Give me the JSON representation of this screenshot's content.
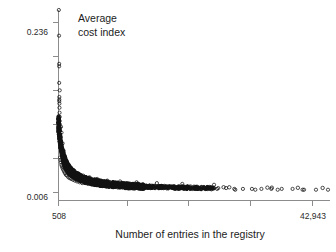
{
  "chart_data": {
    "type": "scatter",
    "title": "",
    "annotation": {
      "line1": "Average",
      "line2": "cost index"
    },
    "xlabel": "Number of entries in the registry",
    "ylabel": "Average cost index",
    "xlim": [
      508,
      42943
    ],
    "ylim": [
      0.006,
      0.236
    ],
    "xtick_labels": [
      "508",
      "42,943"
    ],
    "ytick_labels": [
      "0.236",
      "0.006"
    ],
    "x_min_label": "508",
    "x_max_label": "42,943",
    "y_min_label": "0.006",
    "y_max_label": "0.236",
    "grid": false,
    "legend": null,
    "marker": "open-circle",
    "marker_color": "#111111",
    "n_xticks": 5,
    "n_yticks": 6,
    "points": [
      [
        560,
        0.236
      ],
      [
        590,
        0.205
      ],
      [
        610,
        0.171
      ],
      [
        605,
        0.168
      ],
      [
        612,
        0.148
      ],
      [
        700,
        0.139
      ],
      [
        640,
        0.131
      ],
      [
        628,
        0.128
      ],
      [
        630,
        0.126
      ],
      [
        648,
        0.123
      ],
      [
        660,
        0.118
      ],
      [
        672,
        0.112
      ],
      [
        690,
        0.107
      ],
      [
        700,
        0.102
      ],
      [
        712,
        0.098
      ],
      [
        726,
        0.094
      ],
      [
        742,
        0.09
      ],
      [
        760,
        0.086
      ],
      [
        780,
        0.083
      ],
      [
        800,
        0.08
      ],
      [
        824,
        0.077
      ],
      [
        850,
        0.074
      ],
      [
        878,
        0.071
      ],
      [
        906,
        0.068
      ],
      [
        938,
        0.066
      ],
      [
        972,
        0.064
      ],
      [
        1008,
        0.062
      ],
      [
        1046,
        0.06
      ],
      [
        1086,
        0.058
      ],
      [
        1128,
        0.056
      ],
      [
        1172,
        0.054
      ],
      [
        1220,
        0.053
      ],
      [
        1270,
        0.051
      ],
      [
        1324,
        0.05
      ],
      [
        1380,
        0.048
      ],
      [
        1440,
        0.047
      ],
      [
        1504,
        0.046
      ],
      [
        1570,
        0.045
      ],
      [
        1640,
        0.044
      ],
      [
        1714,
        0.043
      ],
      [
        1792,
        0.042
      ],
      [
        1874,
        0.041
      ],
      [
        1960,
        0.04
      ],
      [
        2050,
        0.039
      ],
      [
        2146,
        0.038
      ],
      [
        2246,
        0.037
      ],
      [
        2352,
        0.037
      ],
      [
        2462,
        0.036
      ],
      [
        2578,
        0.035
      ],
      [
        2700,
        0.035
      ],
      [
        2828,
        0.034
      ],
      [
        2962,
        0.033
      ],
      [
        3104,
        0.033
      ],
      [
        3252,
        0.032
      ],
      [
        3408,
        0.032
      ],
      [
        3570,
        0.031
      ],
      [
        3742,
        0.031
      ],
      [
        3920,
        0.03
      ],
      [
        4108,
        0.03
      ],
      [
        4306,
        0.029
      ],
      [
        4512,
        0.029
      ],
      [
        4728,
        0.028
      ],
      [
        4956,
        0.028
      ],
      [
        5194,
        0.028
      ],
      [
        5444,
        0.027
      ],
      [
        5706,
        0.027
      ],
      [
        5980,
        0.027
      ],
      [
        6268,
        0.026
      ],
      [
        6570,
        0.026
      ],
      [
        6886,
        0.026
      ],
      [
        7218,
        0.025
      ],
      [
        7564,
        0.025
      ],
      [
        7928,
        0.025
      ],
      [
        8310,
        0.025
      ],
      [
        8710,
        0.024
      ],
      [
        9128,
        0.024
      ],
      [
        9568,
        0.024
      ],
      [
        10028,
        0.024
      ],
      [
        10510,
        0.024
      ],
      [
        11016,
        0.023
      ],
      [
        11546,
        0.023
      ],
      [
        12102,
        0.023
      ],
      [
        12684,
        0.023
      ],
      [
        13294,
        0.023
      ],
      [
        13934,
        0.023
      ],
      [
        14604,
        0.022
      ],
      [
        15306,
        0.022
      ],
      [
        16042,
        0.022
      ],
      [
        16814,
        0.022
      ],
      [
        17622,
        0.022
      ],
      [
        18470,
        0.022
      ],
      [
        19358,
        0.022
      ],
      [
        20290,
        0.021
      ],
      [
        21266,
        0.021
      ],
      [
        22290,
        0.021
      ],
      [
        23362,
        0.021
      ],
      [
        24486,
        0.021
      ],
      [
        25664,
        0.021
      ],
      [
        26898,
        0.021
      ],
      [
        28192,
        0.02
      ],
      [
        29548,
        0.02
      ],
      [
        30968,
        0.02
      ],
      [
        32458,
        0.02
      ],
      [
        34018,
        0.02
      ],
      [
        35654,
        0.02
      ],
      [
        37368,
        0.02
      ],
      [
        39166,
        0.019
      ],
      [
        41050,
        0.019
      ],
      [
        42943,
        0.019
      ],
      [
        900,
        0.095
      ],
      [
        980,
        0.088
      ],
      [
        1150,
        0.075
      ],
      [
        1320,
        0.066
      ],
      [
        1500,
        0.06
      ],
      [
        1760,
        0.054
      ],
      [
        2100,
        0.049
      ],
      [
        2500,
        0.045
      ],
      [
        3000,
        0.042
      ],
      [
        3600,
        0.039
      ],
      [
        4400,
        0.036
      ],
      [
        5400,
        0.034
      ],
      [
        6600,
        0.032
      ],
      [
        8200,
        0.03
      ],
      [
        10200,
        0.029
      ],
      [
        12800,
        0.028
      ],
      [
        16000,
        0.027
      ],
      [
        20000,
        0.026
      ],
      [
        25000,
        0.025
      ],
      [
        760,
        0.058
      ],
      [
        820,
        0.055
      ],
      [
        890,
        0.052
      ],
      [
        960,
        0.049
      ],
      [
        1050,
        0.047
      ],
      [
        1150,
        0.045
      ],
      [
        1260,
        0.043
      ],
      [
        1380,
        0.041
      ],
      [
        1520,
        0.039
      ],
      [
        1680,
        0.037
      ],
      [
        1860,
        0.036
      ],
      [
        2060,
        0.034
      ],
      [
        2280,
        0.033
      ],
      [
        2520,
        0.032
      ],
      [
        2800,
        0.031
      ],
      [
        3100,
        0.03
      ],
      [
        3440,
        0.029
      ],
      [
        3820,
        0.028
      ],
      [
        4240,
        0.027
      ],
      [
        4700,
        0.027
      ],
      [
        5220,
        0.026
      ],
      [
        5800,
        0.025
      ],
      [
        6440,
        0.025
      ],
      [
        7160,
        0.024
      ],
      [
        7960,
        0.024
      ],
      [
        8840,
        0.023
      ],
      [
        9820,
        0.023
      ],
      [
        10920,
        0.022
      ],
      [
        12140,
        0.022
      ],
      [
        13500,
        0.022
      ],
      [
        15000,
        0.021
      ],
      [
        16680,
        0.021
      ],
      [
        18540,
        0.021
      ],
      [
        20620,
        0.02
      ],
      [
        22920,
        0.02
      ],
      [
        25480,
        0.02
      ],
      [
        28340,
        0.019
      ],
      [
        31500,
        0.019
      ],
      [
        35020,
        0.019
      ],
      [
        38940,
        0.019
      ]
    ]
  },
  "axes": {
    "x_tick_count": 5,
    "y_tick_count": 6
  }
}
